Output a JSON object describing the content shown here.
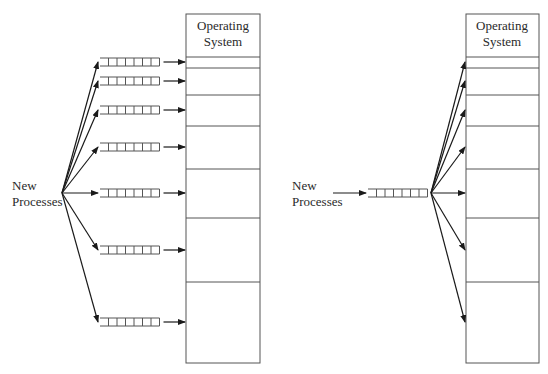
{
  "diagram": {
    "left": {
      "title": "Multiple queues (one per partition)",
      "input_label_line1": "New",
      "input_label_line2": "Processes",
      "memory": {
        "os_label_line1": "Operating",
        "os_label_line2": "System",
        "x": 186,
        "width": 74,
        "top": 14,
        "os_bottom": 57,
        "partition_boundaries": [
          57,
          68,
          95,
          126,
          169,
          218,
          282,
          363
        ]
      },
      "queues": [
        {
          "y": 62
        },
        {
          "y": 81
        },
        {
          "y": 110
        },
        {
          "y": 147
        },
        {
          "y": 193
        },
        {
          "y": 250
        },
        {
          "y": 322
        }
      ],
      "queue_cells": 7,
      "fan_origin": {
        "x": 62,
        "y": 193
      }
    },
    "right": {
      "title": "Single input queue",
      "input_label_line1": "New",
      "input_label_line2": "Processes",
      "memory": {
        "os_label_line1": "Operating",
        "os_label_line2": "System",
        "x": 466,
        "width": 73,
        "top": 14,
        "os_bottom": 57,
        "partition_boundaries": [
          57,
          68,
          95,
          126,
          169,
          218,
          282,
          363
        ]
      },
      "queue": {
        "x": 368,
        "y": 193,
        "cells": 7
      },
      "fan_origin": {
        "x": 431,
        "y": 193
      },
      "arrow_targets_y": [
        62,
        81,
        110,
        147,
        193,
        250,
        322
      ]
    }
  }
}
